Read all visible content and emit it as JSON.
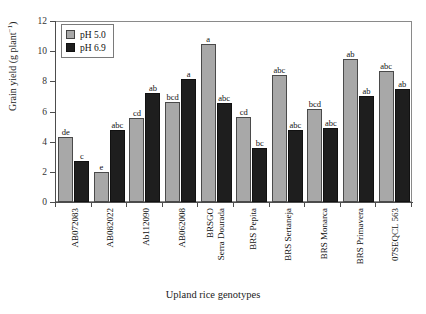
{
  "chart_data": {
    "type": "bar",
    "title": "",
    "xlabel": "Upland rice genotypes",
    "ylabel": "Grain yield (g plant",
    "ylabel_sup": "−1",
    "ylabel_tail": ")",
    "ylim": [
      0,
      12
    ],
    "yticks": [
      0,
      2,
      4,
      6,
      8,
      10,
      12
    ],
    "ytick_labels": [
      "0",
      "2",
      "4",
      "6",
      "8",
      "10",
      "12"
    ],
    "grid": false,
    "legend_position": "upper left",
    "categories": [
      "AB072083",
      "AB082022",
      "Ab112090",
      "AB062008",
      "BRSGO\nSerra Dourada",
      "BRS Pepita",
      "BRS Sertaneja",
      "BRS Monarca",
      "BRS Primavera",
      "07SEQCL 563"
    ],
    "category_lines": [
      [
        "AB072083"
      ],
      [
        "AB082022"
      ],
      [
        "Ab112090"
      ],
      [
        "AB062008"
      ],
      [
        "BRSGO",
        "Serra Dourada"
      ],
      [
        "BRS Pepita"
      ],
      [
        "BRS Sertaneja"
      ],
      [
        "BRS Monarca"
      ],
      [
        "BRS Primavera"
      ],
      [
        "07SEQCL 563"
      ]
    ],
    "series": [
      {
        "name": "pH 5.0",
        "color": "#a8a8a8",
        "values": [
          4.3,
          2.0,
          5.55,
          6.6,
          10.45,
          5.65,
          8.4,
          6.15,
          9.5,
          8.7
        ],
        "annotations": [
          "de",
          "e",
          "cd",
          "bcd",
          "a",
          "cd",
          "abc",
          "bcd",
          "ab",
          "abc"
        ]
      },
      {
        "name": "pH 6.9",
        "color": "#1e1e1e",
        "values": [
          2.7,
          4.8,
          7.2,
          8.15,
          6.55,
          3.6,
          4.8,
          4.9,
          7.05,
          7.5
        ],
        "annotations": [
          "c",
          "abc",
          "ab",
          "a",
          "abc",
          "bc",
          "abc",
          "abc",
          "ab",
          "ab"
        ]
      }
    ]
  },
  "legend": {
    "items": [
      {
        "label": "pH 5.0",
        "color": "#a8a8a8"
      },
      {
        "label": "pH 6.9",
        "color": "#1e1e1e"
      }
    ]
  }
}
